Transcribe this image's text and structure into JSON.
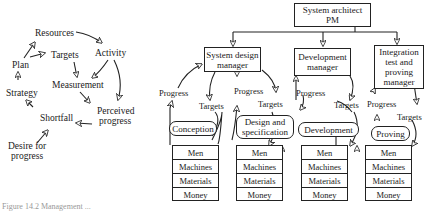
{
  "cycle": {
    "nodes": {
      "resources": "Resources",
      "activity": "Activity",
      "targets": "Targets",
      "plan": "Plan",
      "measurement": "Measurement",
      "strategy": "Strategy",
      "perceived_progress_1": "Perceived",
      "perceived_progress_2": "progress",
      "shortfall": "Shortfall",
      "desire_1": "Desire for",
      "desire_2": "progress"
    }
  },
  "org": {
    "top": {
      "line1": "System architect",
      "line2": "PM"
    },
    "managers": [
      {
        "line1": "System design",
        "line2": "manager"
      },
      {
        "line1": "Development",
        "line2": "manager"
      },
      {
        "line1": "Integration",
        "line2": "test and",
        "line3": "proving",
        "line4": "manager"
      }
    ],
    "phases": [
      {
        "line1": "Conception"
      },
      {
        "line1": "Design and",
        "line2": "specification"
      },
      {
        "line1": "Development"
      },
      {
        "line1": "Proving"
      }
    ],
    "resources": [
      "Men",
      "Machines",
      "Materials",
      "Money"
    ],
    "progress_label": "Progress",
    "targets_label": "Targets"
  },
  "caption": "Figure 14.2 Management ..."
}
